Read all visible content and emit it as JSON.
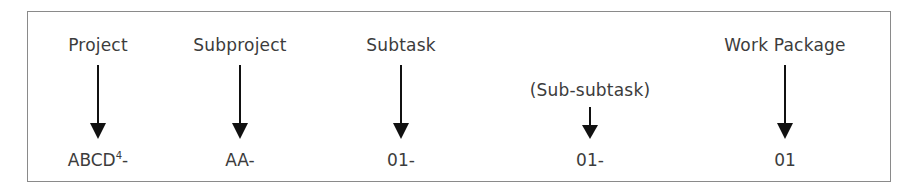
{
  "diagram": {
    "levels": [
      {
        "label": "Project",
        "code": "ABCD",
        "superscript": "4",
        "suffix": "-",
        "x": 98
      },
      {
        "label": "Subproject",
        "code": "AA",
        "superscript": "",
        "suffix": "-",
        "x": 240
      },
      {
        "label": "Subtask",
        "code": "01",
        "superscript": "",
        "suffix": "-",
        "x": 401
      },
      {
        "label": "(Sub-subtask)",
        "code": "01",
        "superscript": "",
        "suffix": "-",
        "x": 590
      },
      {
        "label": "Work Package",
        "code": "01",
        "superscript": "",
        "suffix": "",
        "x": 785
      }
    ]
  }
}
